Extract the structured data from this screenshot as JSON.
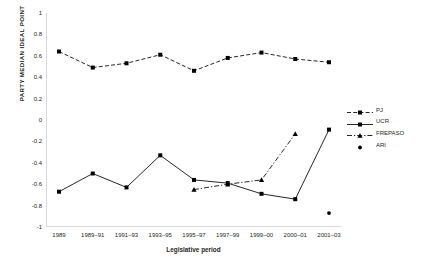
{
  "chart_data": {
    "type": "line",
    "title": "",
    "xlabel": "Legislative period",
    "ylabel": "PARTY MEDIAN IDEAL POINT",
    "categories": [
      "1989",
      "1989–91",
      "1991–93",
      "1993–95",
      "1995–97",
      "1997–99",
      "1999–00",
      "2000–01",
      "2001–03"
    ],
    "ylim": [
      -1,
      1
    ],
    "ytick_labels": [
      "1",
      "0.8",
      "0.6",
      "0.4",
      "0.2",
      "0",
      "-0.2",
      "-0.4",
      "-0.6",
      "-0.8",
      "-1"
    ],
    "ytick_values": [
      1,
      0.8,
      0.6,
      0.4,
      0.2,
      0,
      -0.2,
      -0.4,
      -0.6,
      -0.8,
      -1
    ],
    "grid": false,
    "legend_position": "right",
    "series": [
      {
        "name": "PJ",
        "style": "dashed",
        "marker": "square",
        "color": "#000000",
        "values": [
          0.64,
          0.49,
          0.53,
          0.61,
          0.46,
          0.58,
          0.63,
          0.57,
          0.54
        ]
      },
      {
        "name": "UCR",
        "style": "solid",
        "marker": "square",
        "color": "#000000",
        "values": [
          -0.67,
          -0.5,
          -0.63,
          -0.33,
          -0.56,
          -0.59,
          -0.69,
          -0.74,
          -0.09
        ]
      },
      {
        "name": "FREPASO",
        "style": "dash-dot",
        "marker": "triangle",
        "color": "#000000",
        "values": [
          null,
          null,
          null,
          null,
          -0.65,
          -0.6,
          -0.56,
          -0.13,
          null
        ]
      },
      {
        "name": "ARI",
        "style": "none",
        "marker": "dot",
        "color": "#000000",
        "values": [
          null,
          null,
          null,
          null,
          null,
          null,
          null,
          null,
          -0.87
        ]
      }
    ]
  },
  "legend": {
    "items": [
      {
        "label": "PJ",
        "key": "dashed-square-key"
      },
      {
        "label": "UCR",
        "key": "solid-square-key"
      },
      {
        "label": "FREPASO",
        "key": "dashdot-triangle-key"
      },
      {
        "label": "ARI",
        "key": "dot-key"
      }
    ]
  }
}
